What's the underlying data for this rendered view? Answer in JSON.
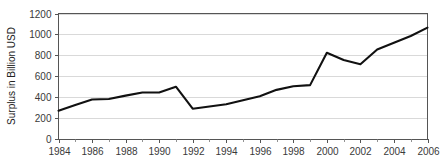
{
  "chart_data": {
    "type": "line",
    "title": "",
    "xlabel": "",
    "ylabel": "Surplus in Billion USD",
    "ylim": [
      0,
      1200
    ],
    "xlim": [
      1984,
      2006
    ],
    "yticks": [
      0,
      200,
      400,
      600,
      800,
      1000,
      1200
    ],
    "ytick_labels": [
      "0",
      "200",
      "400",
      "600",
      "800",
      "1000",
      "1200"
    ],
    "xticks": [
      1984,
      1986,
      1988,
      1990,
      1992,
      1994,
      1996,
      1998,
      2000,
      2002,
      2004,
      2006
    ],
    "xtick_labels": [
      "1984",
      "1986",
      "1988",
      "1990",
      "1992",
      "1994",
      "1996",
      "1998",
      "2000",
      "2002",
      "2004",
      "2006"
    ],
    "x_minor_ticks": [
      1985,
      1987,
      1989,
      1991,
      1993,
      1995,
      1997,
      1999,
      2001,
      2003,
      2005
    ],
    "grid": "horizontal",
    "legend": "none",
    "x": [
      1984,
      1985,
      1986,
      1987,
      1988,
      1989,
      1990,
      1991,
      1992,
      1993,
      1994,
      1995,
      1996,
      1997,
      1998,
      1999,
      2000,
      2001,
      2002,
      2003,
      2004,
      2005,
      2006
    ],
    "series": [
      {
        "name": "Surplus",
        "color": "#111111",
        "values": [
          270,
          325,
          378,
          382,
          415,
          445,
          445,
          500,
          290,
          310,
          332,
          370,
          408,
          470,
          505,
          515,
          825,
          755,
          715,
          855,
          920,
          985,
          1065
        ]
      }
    ],
    "colors": {
      "line": "#111111",
      "gridline": "#c9c9c9",
      "border": "#555555",
      "text": "#3a3a3a",
      "background": "#ffffff"
    }
  },
  "axis": {
    "y_title": "Surplus in Billion USD"
  }
}
